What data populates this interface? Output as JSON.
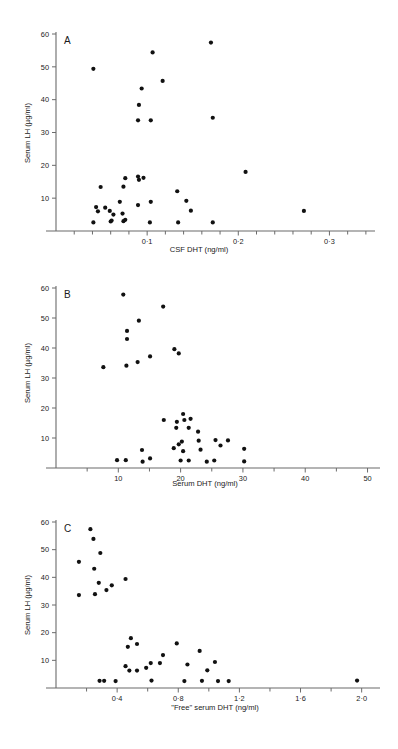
{
  "figure": {
    "panels": [
      "A",
      "B",
      "C"
    ],
    "shared_ylabel": "Serum LH (µg/ml)"
  },
  "chart_data": [
    {
      "type": "scatter",
      "panel_label": "A",
      "title": "",
      "xlabel": "CSF DHT (ng/ml)",
      "ylabel": "Serum LH (µg/ml)",
      "xlim": [
        0,
        0.35
      ],
      "ylim": [
        0,
        60
      ],
      "xticks": [
        0.1,
        0.2,
        0.3
      ],
      "xticklabels": [
        "0·1",
        "0·2",
        "0·3"
      ],
      "xminorticks": [
        0.02,
        0.04,
        0.06,
        0.08,
        0.12,
        0.14,
        0.16,
        0.18,
        0.22,
        0.24,
        0.26,
        0.28,
        0.32,
        0.34
      ],
      "yticks": [
        10,
        20,
        30,
        40,
        50,
        60
      ],
      "yticklabels": [
        "10",
        "20",
        "30",
        "40",
        "50",
        "60"
      ],
      "grid": false,
      "legend": "none",
      "points": [
        [
          0.041,
          49.4
        ],
        [
          0.094,
          43.4
        ],
        [
          0.091,
          38.4
        ],
        [
          0.09,
          33.7
        ],
        [
          0.106,
          54.4
        ],
        [
          0.117,
          45.7
        ],
        [
          0.104,
          33.7
        ],
        [
          0.17,
          57.4
        ],
        [
          0.172,
          34.5
        ],
        [
          0.208,
          18.0
        ],
        [
          0.096,
          16.2
        ],
        [
          0.091,
          15.6
        ],
        [
          0.09,
          16.6
        ],
        [
          0.076,
          16.1
        ],
        [
          0.074,
          13.5
        ],
        [
          0.049,
          13.4
        ],
        [
          0.133,
          12.1
        ],
        [
          0.143,
          9.2
        ],
        [
          0.104,
          8.9
        ],
        [
          0.09,
          7.9
        ],
        [
          0.07,
          8.9
        ],
        [
          0.044,
          7.3
        ],
        [
          0.046,
          6.0
        ],
        [
          0.054,
          7.1
        ],
        [
          0.059,
          6.1
        ],
        [
          0.073,
          5.3
        ],
        [
          0.063,
          5.0
        ],
        [
          0.148,
          6.2
        ],
        [
          0.272,
          6.1
        ],
        [
          0.041,
          2.6
        ],
        [
          0.06,
          2.9
        ],
        [
          0.061,
          3.2
        ],
        [
          0.074,
          3.0
        ],
        [
          0.076,
          3.4
        ],
        [
          0.103,
          2.6
        ],
        [
          0.134,
          2.6
        ],
        [
          0.172,
          2.6
        ]
      ]
    },
    {
      "type": "scatter",
      "panel_label": "B",
      "title": "",
      "xlabel": "Serum DHT (ng/ml)",
      "ylabel": "Serum LH (µg/ml)",
      "xlim": [
        0,
        52
      ],
      "ylim": [
        0,
        60
      ],
      "xticks": [
        10,
        20,
        30,
        40,
        50
      ],
      "xticklabels": [
        "10",
        "20",
        "30",
        "40",
        "50"
      ],
      "xminorticks": [
        5,
        15,
        25,
        35,
        45
      ],
      "yticks": [
        10,
        20,
        30,
        40,
        50,
        60
      ],
      "yticklabels": [
        "10",
        "20",
        "30",
        "40",
        "50",
        "60"
      ],
      "grid": false,
      "legend": "none",
      "points": [
        [
          10.8,
          57.8
        ],
        [
          11.4,
          45.7
        ],
        [
          11.4,
          43.0
        ],
        [
          11.3,
          34.1
        ],
        [
          13.3,
          49.1
        ],
        [
          13.1,
          35.3
        ],
        [
          15.1,
          37.2
        ],
        [
          17.2,
          53.8
        ],
        [
          19.0,
          39.6
        ],
        [
          19.7,
          38.2
        ],
        [
          7.6,
          33.6
        ],
        [
          20.4,
          18.0
        ],
        [
          17.3,
          16.0
        ],
        [
          19.4,
          15.4
        ],
        [
          21.6,
          16.4
        ],
        [
          20.6,
          16.0
        ],
        [
          19.3,
          13.4
        ],
        [
          21.3,
          13.4
        ],
        [
          22.8,
          12.1
        ],
        [
          22.9,
          9.1
        ],
        [
          25.6,
          9.3
        ],
        [
          27.6,
          9.2
        ],
        [
          19.7,
          7.9
        ],
        [
          26.4,
          7.5
        ],
        [
          20.2,
          8.8
        ],
        [
          18.9,
          6.6
        ],
        [
          13.8,
          6.0
        ],
        [
          23.2,
          6.1
        ],
        [
          30.2,
          6.4
        ],
        [
          20.4,
          5.6
        ],
        [
          15.1,
          3.2
        ],
        [
          9.8,
          2.6
        ],
        [
          11.2,
          2.6
        ],
        [
          13.9,
          2.1
        ],
        [
          20.0,
          2.5
        ],
        [
          21.3,
          2.5
        ],
        [
          24.2,
          2.1
        ],
        [
          25.4,
          2.5
        ],
        [
          30.2,
          2.2
        ]
      ]
    },
    {
      "type": "scatter",
      "panel_label": "C",
      "title": "",
      "xlabel": "\"Free\" serum DHT (ng/ml)",
      "ylabel": "Serum LH (µg/ml)",
      "xlim": [
        0,
        2.12
      ],
      "ylim": [
        0,
        60
      ],
      "xticks": [
        0.4,
        0.8,
        1.2,
        1.6,
        2.0
      ],
      "xticklabels": [
        "0·4",
        "0·8",
        "1·2",
        "1·6",
        "2·0"
      ],
      "xminorticks": [
        0.2,
        0.6,
        1.0,
        1.4,
        1.8
      ],
      "yticks": [
        10,
        20,
        30,
        40,
        50,
        60
      ],
      "yticklabels": [
        "10",
        "20",
        "30",
        "40",
        "50",
        "60"
      ],
      "grid": false,
      "legend": "none",
      "points": [
        [
          0.225,
          57.4
        ],
        [
          0.245,
          53.9
        ],
        [
          0.15,
          45.6
        ],
        [
          0.29,
          48.8
        ],
        [
          0.25,
          43.1
        ],
        [
          0.28,
          38.0
        ],
        [
          0.15,
          33.6
        ],
        [
          0.255,
          33.9
        ],
        [
          0.33,
          35.4
        ],
        [
          0.365,
          37.1
        ],
        [
          0.455,
          39.4
        ],
        [
          0.49,
          18.0
        ],
        [
          0.47,
          14.9
        ],
        [
          0.53,
          15.9
        ],
        [
          0.79,
          16.1
        ],
        [
          0.7,
          11.9
        ],
        [
          0.94,
          13.4
        ],
        [
          0.455,
          7.9
        ],
        [
          0.62,
          9.0
        ],
        [
          0.68,
          9.0
        ],
        [
          0.59,
          7.3
        ],
        [
          0.86,
          8.5
        ],
        [
          1.04,
          9.4
        ],
        [
          0.48,
          6.3
        ],
        [
          0.53,
          6.3
        ],
        [
          0.99,
          6.4
        ],
        [
          0.285,
          2.6
        ],
        [
          0.315,
          2.6
        ],
        [
          0.39,
          2.5
        ],
        [
          0.625,
          2.7
        ],
        [
          0.84,
          2.5
        ],
        [
          0.955,
          2.6
        ],
        [
          1.06,
          2.5
        ],
        [
          1.13,
          2.5
        ],
        [
          1.97,
          2.7
        ]
      ]
    }
  ]
}
